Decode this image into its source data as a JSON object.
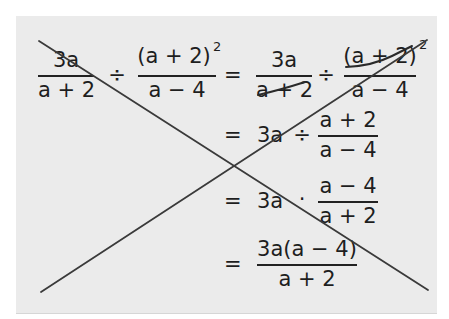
{
  "content": {
    "row1": {
      "frac1": {
        "numerator": "3a",
        "denominator": "a + 2"
      },
      "op1": "÷",
      "frac2": {
        "numerator": "(a + 2)",
        "exponent": "2",
        "denominator": "a − 4"
      },
      "equals": "=",
      "frac3": {
        "numerator": "3a",
        "denominator": "a + 2",
        "denominator_cancelled": true
      },
      "op2": "÷",
      "frac4": {
        "numerator": "(a + 2)",
        "exponent": "2",
        "numerator_cancelled": true,
        "denominator": "a − 4"
      }
    },
    "row2": {
      "equals": "=",
      "term": "3a",
      "op": "÷",
      "frac": {
        "numerator": "a + 2",
        "denominator": "a − 4"
      }
    },
    "row3": {
      "equals": "=",
      "term": "3a",
      "op": "·",
      "frac": {
        "numerator": "a − 4",
        "denominator": "a + 2"
      }
    },
    "row4": {
      "equals": "=",
      "frac": {
        "numerator": "3a(a − 4)",
        "denominator": "a + 2"
      }
    }
  },
  "crossout": {
    "description": "Large X drawn across the whole worked solution",
    "line1": {
      "x1": 39,
      "y1": 41,
      "x2": 428,
      "y2": 290
    },
    "line2": {
      "x1": 41,
      "y1": 292,
      "x2": 427,
      "y2": 40
    }
  },
  "colors": {
    "background": "#ffffff",
    "panel": "#ebebeb",
    "ink": "#1e1e1e",
    "strike": "#3a3a3a"
  }
}
